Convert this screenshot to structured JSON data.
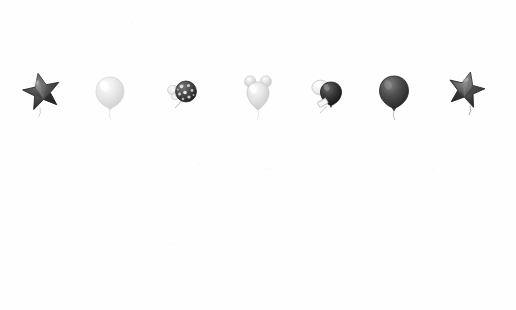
{
  "canvas": {
    "width": 516,
    "height": 310,
    "background": "#fefefe",
    "description": "Row of seven grayscale party objects on a blank white background"
  },
  "row": {
    "center_y": 92,
    "count": 7,
    "items": [
      {
        "index": 1,
        "name": "Star balloon",
        "shape": "star",
        "points": 5,
        "tone": "dark",
        "fill": "#3a3a3a",
        "highlight": "#8e8e8e",
        "outline": "#2a2a2a",
        "x": 42,
        "y": 92,
        "size": 34,
        "rotation": -12
      },
      {
        "index": 2,
        "name": "Round balloon",
        "shape": "balloon",
        "tone": "light",
        "fill": "#e2e2e2",
        "highlight": "#f7f7f7",
        "outline": "#d2d2d2",
        "x": 110,
        "y": 93,
        "size": 26,
        "rotation": 0
      },
      {
        "index": 3,
        "name": "Polka dot ball with clip",
        "shape": "dotted-ball",
        "tone": "dark",
        "fill": "#4a4a4a",
        "highlight": "#cfcfcf",
        "outline": "#2f2f2f",
        "x": 180,
        "y": 92,
        "size": 22,
        "rotation": 0
      },
      {
        "index": 4,
        "name": "Mouse head balloon",
        "shape": "mouse-head",
        "tone": "light",
        "fill": "#dcdcdc",
        "highlight": "#f4f4f4",
        "outline": "#cacaca",
        "x": 258,
        "y": 92,
        "size": 27,
        "rotation": 0
      },
      {
        "index": 5,
        "name": "Paired balloons with tag",
        "shape": "paired-balloons",
        "tone": "mixed",
        "fill": "#333333",
        "highlight": "#ededed",
        "outline": "#bdbdbd",
        "x": 325,
        "y": 92,
        "size": 24,
        "rotation": 0
      },
      {
        "index": 6,
        "name": "Round balloon",
        "shape": "balloon",
        "tone": "dark",
        "fill": "#4f4f4f",
        "highlight": "#7d7d7d",
        "outline": "#3c3c3c",
        "x": 394,
        "y": 92,
        "size": 26,
        "rotation": 0
      },
      {
        "index": 7,
        "name": "Star balloon",
        "shape": "star",
        "points": 5,
        "tone": "dark",
        "fill": "#3f3f3f",
        "highlight": "#8a8a8a",
        "outline": "#2b2b2b",
        "x": 466,
        "y": 90,
        "size": 33,
        "rotation": 14
      }
    ]
  },
  "specks": [
    {
      "x": 131,
      "y": 22,
      "tone": "#f4f4f6"
    },
    {
      "x": 198,
      "y": 163,
      "tone": "#f3f3f5"
    },
    {
      "x": 270,
      "y": 168,
      "tone": "#f5f5f7"
    },
    {
      "x": 432,
      "y": 168,
      "tone": "#f4f4f6"
    },
    {
      "x": 436,
      "y": 180,
      "tone": "#f5f5f7"
    },
    {
      "x": 172,
      "y": 243,
      "tone": "#f2f2f5"
    },
    {
      "x": 405,
      "y": 212,
      "tone": "#f4f4f6"
    },
    {
      "x": 345,
      "y": 268,
      "tone": "#f5f5f7"
    },
    {
      "x": 73,
      "y": 226,
      "tone": "#f5f5f7"
    },
    {
      "x": 340,
      "y": 267,
      "tone": "#f6f6f8"
    },
    {
      "x": 412,
      "y": 300,
      "tone": "#f4f4f6"
    },
    {
      "x": 266,
      "y": 168,
      "tone": "#f6f6f8"
    }
  ]
}
